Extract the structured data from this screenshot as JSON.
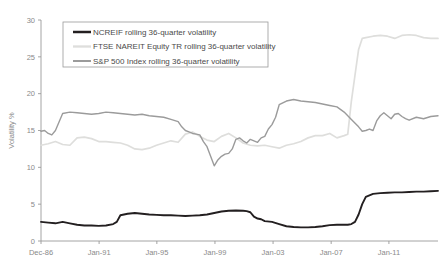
{
  "chart_data": {
    "type": "line",
    "title": "",
    "xlabel": "",
    "ylabel": "Volatility %",
    "ylim": [
      0,
      30
    ],
    "yticks": [
      0,
      5,
      10,
      15,
      20,
      25,
      30
    ],
    "ytick_labels": [
      "0",
      "5",
      "10",
      "15",
      "20",
      "25",
      "30"
    ],
    "grid": false,
    "legend_position": "top-center",
    "xtick_labels": [
      "Dec-86",
      "Jan-91",
      "Jan-95",
      "Jan-99",
      "Jan-03",
      "Jan-07",
      "Jan-11"
    ],
    "xtick_values": [
      0,
      16.1,
      32.1,
      48.2,
      64.3,
      80.4,
      96.4
    ],
    "xlim": [
      0,
      110
    ],
    "series": [
      {
        "name": "NCREIF rolling 36-quarter volatility",
        "color": "#231f20",
        "width": 1.9,
        "x": [
          0,
          2,
          4,
          6,
          8,
          10,
          12,
          14,
          16,
          18,
          20,
          21,
          22,
          23,
          24,
          26,
          28,
          30,
          32,
          34,
          36,
          38,
          40,
          42,
          44,
          46,
          48,
          50,
          52,
          54,
          56,
          57,
          58,
          59,
          60,
          61,
          62,
          64,
          66,
          68,
          70,
          72,
          74,
          76,
          78,
          80,
          82,
          84,
          85,
          86,
          87,
          88,
          89,
          90,
          92,
          94,
          96,
          98,
          100,
          102,
          104,
          106,
          108,
          110
        ],
        "values": [
          2.6,
          2.5,
          2.4,
          2.6,
          2.4,
          2.2,
          2.1,
          2.1,
          2.05,
          2.1,
          2.3,
          2.6,
          3.5,
          3.6,
          3.7,
          3.8,
          3.7,
          3.6,
          3.55,
          3.5,
          3.5,
          3.45,
          3.4,
          3.45,
          3.5,
          3.6,
          3.8,
          4.0,
          4.1,
          4.15,
          4.1,
          4.05,
          3.9,
          3.3,
          3.05,
          2.95,
          2.7,
          2.6,
          2.3,
          2.0,
          1.9,
          1.85,
          1.85,
          1.9,
          2.0,
          2.15,
          2.2,
          2.2,
          2.2,
          2.3,
          2.6,
          3.6,
          5.0,
          6.0,
          6.4,
          6.5,
          6.55,
          6.6,
          6.6,
          6.65,
          6.7,
          6.7,
          6.75,
          6.8
        ]
      },
      {
        "name": "FTSE NAREIT Equity TR rolling 36-quarter volatility",
        "color": "#dededc",
        "width": 1.7,
        "x": [
          0,
          2,
          4,
          6,
          8,
          10,
          12,
          14,
          16,
          18,
          20,
          22,
          24,
          26,
          28,
          30,
          32,
          34,
          36,
          38,
          40,
          42,
          44,
          46,
          48,
          50,
          52,
          54,
          56,
          58,
          60,
          62,
          64,
          66,
          68,
          70,
          72,
          74,
          76,
          78,
          80,
          82,
          84,
          85,
          86,
          87,
          88,
          89,
          90,
          92,
          94,
          96,
          98,
          100,
          102,
          104,
          106,
          108,
          110
        ],
        "values": [
          13.0,
          13.2,
          13.5,
          13.1,
          13.0,
          14.0,
          14.1,
          13.9,
          13.5,
          13.5,
          13.4,
          13.3,
          13.0,
          12.5,
          12.4,
          12.6,
          13.0,
          13.3,
          13.6,
          13.4,
          14.5,
          14.8,
          14.2,
          13.7,
          13.5,
          14.2,
          14.6,
          14.0,
          13.3,
          13.0,
          12.9,
          13.0,
          12.8,
          12.6,
          13.0,
          13.2,
          13.5,
          14.0,
          14.3,
          14.3,
          14.6,
          14.0,
          14.3,
          14.5,
          19.0,
          22.5,
          26.0,
          27.5,
          27.6,
          27.8,
          27.9,
          27.8,
          27.5,
          27.9,
          28.0,
          27.9,
          27.6,
          27.5,
          27.5
        ]
      },
      {
        "name": "S&P 500 Index rolling 36-quarter volatility",
        "color": "#9b9b9b",
        "width": 1.4,
        "x": [
          0,
          1,
          2,
          3,
          4,
          6,
          8,
          10,
          12,
          14,
          16,
          18,
          20,
          22,
          24,
          26,
          28,
          30,
          32,
          34,
          36,
          38,
          39,
          40,
          41,
          42,
          43,
          44,
          45,
          46,
          47,
          48,
          49,
          50,
          51,
          52,
          53,
          54,
          55,
          56,
          57,
          58,
          59,
          60,
          61,
          62,
          63,
          64,
          65,
          66,
          68,
          70,
          72,
          74,
          76,
          78,
          80,
          82,
          84,
          86,
          88,
          89,
          90,
          91,
          92,
          93,
          94,
          95,
          96,
          97,
          98,
          99,
          100,
          101,
          102,
          104,
          106,
          108,
          110
        ],
        "values": [
          14.9,
          15.0,
          14.6,
          14.4,
          15.0,
          17.3,
          17.5,
          17.4,
          17.3,
          17.2,
          17.3,
          17.5,
          17.4,
          17.3,
          17.2,
          17.1,
          17.2,
          17.0,
          16.9,
          16.8,
          16.5,
          16.2,
          15.5,
          15.0,
          14.8,
          14.6,
          14.5,
          14.4,
          13.5,
          12.8,
          11.5,
          10.2,
          11.0,
          11.5,
          11.8,
          11.9,
          12.5,
          13.8,
          14.0,
          13.6,
          13.3,
          13.8,
          13.6,
          13.4,
          14.0,
          14.2,
          15.2,
          15.8,
          16.8,
          18.5,
          19.0,
          19.2,
          19.0,
          18.9,
          18.8,
          18.6,
          18.4,
          18.2,
          17.5,
          16.5,
          15.5,
          14.9,
          15.0,
          15.2,
          15.0,
          16.3,
          17.0,
          17.4,
          17.0,
          16.6,
          17.2,
          17.3,
          16.9,
          16.6,
          16.4,
          16.8,
          16.6,
          16.9,
          17.0
        ]
      }
    ]
  },
  "legend": {
    "entries": [
      {
        "label": "NCREIF rolling 36-quarter volatility"
      },
      {
        "label": "FTSE NAREIT Equity TR rolling 36-quarter volatility"
      },
      {
        "label": "S&P 500 Index rolling 36-quarter volatility"
      }
    ]
  },
  "axis": {
    "y_title": "Volatility %"
  }
}
